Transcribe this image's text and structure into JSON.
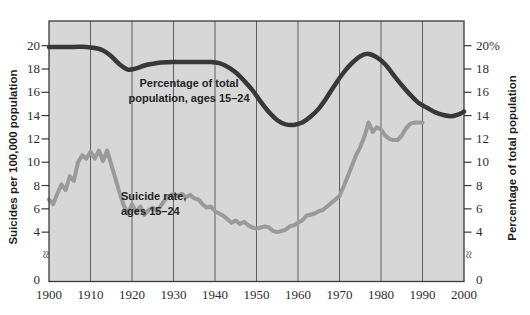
{
  "figure": {
    "left_axis_title": "Suicides per 100,000 population",
    "right_axis_title": "Percentage of total population",
    "axis_break_symbol": "≈",
    "zero_label": "0"
  },
  "annotations": {
    "percentage_label_line1": "Percentage of total",
    "percentage_label_line2": "population, ages 15–24",
    "suicide_label_line1": "Suicide rate,",
    "suicide_label_line2": "ages 15–24"
  },
  "chart_data": {
    "type": "line",
    "title": "",
    "xlabel": "",
    "ylabel_left": "Suicides per 100,000 population",
    "ylabel_right": "Percentage of total population",
    "x_range": [
      1900,
      2000
    ],
    "y_range": [
      0,
      22
    ],
    "y_axis_break_between": [
      0,
      4
    ],
    "grid": "vertical-decades",
    "legend_position": "inline-annotations",
    "x_ticks": [
      "1900",
      "1910",
      "1920",
      "1930",
      "1940",
      "1950",
      "1960",
      "1970",
      "1980",
      "1990",
      "2000"
    ],
    "y_ticks_left": [
      "20",
      "18",
      "16",
      "14",
      "12",
      "10",
      "8",
      "6",
      "4"
    ],
    "y_ticks_right": [
      "20%",
      "18",
      "16",
      "14",
      "12",
      "10",
      "8",
      "6",
      "4"
    ],
    "colors": {
      "plot_bg": "#d7d7d7",
      "gridline": "#5f5f5f",
      "border": "#3a3a3a",
      "percentage_line": "#383838",
      "suicide_line": "#9a9a9a"
    },
    "series": [
      {
        "name": "Percentage of total population, ages 15–24",
        "axis": "right",
        "smooth": true,
        "stroke_width": 4.5,
        "points": [
          [
            1900,
            19.9
          ],
          [
            1903,
            19.9
          ],
          [
            1906,
            19.9
          ],
          [
            1909,
            19.9
          ],
          [
            1911,
            19.8
          ],
          [
            1913,
            19.6
          ],
          [
            1915,
            19.1
          ],
          [
            1917,
            18.4
          ],
          [
            1919,
            17.95
          ],
          [
            1921,
            18.05
          ],
          [
            1923,
            18.3
          ],
          [
            1925,
            18.45
          ],
          [
            1927,
            18.55
          ],
          [
            1930,
            18.6
          ],
          [
            1933,
            18.6
          ],
          [
            1936,
            18.6
          ],
          [
            1939,
            18.6
          ],
          [
            1941,
            18.5
          ],
          [
            1943,
            18.2
          ],
          [
            1945,
            17.7
          ],
          [
            1947,
            17.0
          ],
          [
            1949,
            16.2
          ],
          [
            1951,
            15.2
          ],
          [
            1953,
            14.3
          ],
          [
            1955,
            13.6
          ],
          [
            1957,
            13.25
          ],
          [
            1959,
            13.2
          ],
          [
            1961,
            13.4
          ],
          [
            1963,
            13.9
          ],
          [
            1965,
            14.6
          ],
          [
            1967,
            15.6
          ],
          [
            1969,
            16.7
          ],
          [
            1971,
            17.7
          ],
          [
            1973,
            18.5
          ],
          [
            1975,
            19.1
          ],
          [
            1977,
            19.3
          ],
          [
            1979,
            19.0
          ],
          [
            1981,
            18.4
          ],
          [
            1983,
            17.5
          ],
          [
            1985,
            16.6
          ],
          [
            1987,
            15.8
          ],
          [
            1989,
            15.1
          ],
          [
            1991,
            14.7
          ],
          [
            1993,
            14.3
          ],
          [
            1995,
            14.05
          ],
          [
            1997,
            13.95
          ],
          [
            1999,
            14.15
          ],
          [
            2000,
            14.35
          ]
        ]
      },
      {
        "name": "Suicide rate, ages 15–24",
        "axis": "left",
        "smooth": false,
        "stroke_width": 4,
        "points": [
          [
            1900,
            6.8
          ],
          [
            1901,
            6.4
          ],
          [
            1902,
            7.3
          ],
          [
            1903,
            8.1
          ],
          [
            1904,
            7.6
          ],
          [
            1905,
            8.8
          ],
          [
            1906,
            8.4
          ],
          [
            1907,
            10.0
          ],
          [
            1908,
            10.6
          ],
          [
            1909,
            10.3
          ],
          [
            1910,
            10.9
          ],
          [
            1911,
            10.3
          ],
          [
            1912,
            11.0
          ],
          [
            1913,
            10.1
          ],
          [
            1914,
            11.0
          ],
          [
            1915,
            9.8
          ],
          [
            1916,
            8.6
          ],
          [
            1917,
            7.4
          ],
          [
            1918,
            6.3
          ],
          [
            1919,
            5.6
          ],
          [
            1920,
            6.4
          ],
          [
            1921,
            5.7
          ],
          [
            1922,
            6.2
          ],
          [
            1923,
            5.5
          ],
          [
            1924,
            5.9
          ],
          [
            1925,
            6.1
          ],
          [
            1926,
            5.8
          ],
          [
            1927,
            6.3
          ],
          [
            1928,
            6.8
          ],
          [
            1929,
            7.1
          ],
          [
            1930,
            7.3
          ],
          [
            1931,
            7.1
          ],
          [
            1932,
            7.3
          ],
          [
            1933,
            7.0
          ],
          [
            1934,
            7.2
          ],
          [
            1935,
            6.9
          ],
          [
            1936,
            6.8
          ],
          [
            1937,
            6.4
          ],
          [
            1938,
            6.1
          ],
          [
            1939,
            6.2
          ],
          [
            1940,
            5.8
          ],
          [
            1941,
            5.6
          ],
          [
            1942,
            5.4
          ],
          [
            1943,
            5.1
          ],
          [
            1944,
            4.8
          ],
          [
            1945,
            5.0
          ],
          [
            1946,
            4.7
          ],
          [
            1947,
            4.9
          ],
          [
            1948,
            4.6
          ],
          [
            1949,
            4.4
          ],
          [
            1950,
            4.3
          ],
          [
            1951,
            4.4
          ],
          [
            1952,
            4.5
          ],
          [
            1953,
            4.4
          ],
          [
            1954,
            4.1
          ],
          [
            1955,
            4.0
          ],
          [
            1956,
            4.1
          ],
          [
            1957,
            4.2
          ],
          [
            1958,
            4.5
          ],
          [
            1959,
            4.6
          ],
          [
            1960,
            4.8
          ],
          [
            1961,
            5.0
          ],
          [
            1962,
            5.4
          ],
          [
            1963,
            5.5
          ],
          [
            1964,
            5.6
          ],
          [
            1965,
            5.8
          ],
          [
            1966,
            5.9
          ],
          [
            1967,
            6.2
          ],
          [
            1968,
            6.5
          ],
          [
            1969,
            6.8
          ],
          [
            1970,
            7.1
          ],
          [
            1971,
            7.9
          ],
          [
            1972,
            8.8
          ],
          [
            1973,
            9.7
          ],
          [
            1974,
            10.6
          ],
          [
            1975,
            11.3
          ],
          [
            1976,
            12.2
          ],
          [
            1977,
            13.4
          ],
          [
            1978,
            12.6
          ],
          [
            1979,
            13.0
          ],
          [
            1980,
            12.8
          ],
          [
            1981,
            12.3
          ],
          [
            1982,
            12.0
          ],
          [
            1983,
            11.9
          ],
          [
            1984,
            11.9
          ],
          [
            1985,
            12.3
          ],
          [
            1986,
            12.9
          ],
          [
            1987,
            13.3
          ],
          [
            1988,
            13.4
          ],
          [
            1989,
            13.4
          ],
          [
            1990,
            13.4
          ]
        ]
      }
    ]
  }
}
